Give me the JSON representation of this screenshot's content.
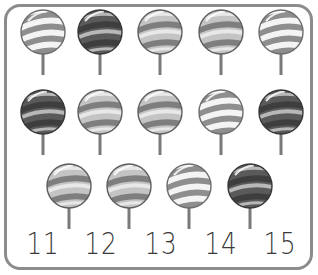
{
  "worksheet": {
    "frame_color": "#8c8c8c",
    "stick_color": "#7a7a7a",
    "lollipops": [
      {
        "row": 1,
        "cx": 43,
        "cy": 32,
        "style": "light"
      },
      {
        "row": 1,
        "cx": 100,
        "cy": 32,
        "style": "dark"
      },
      {
        "row": 1,
        "cx": 160,
        "cy": 32,
        "style": "medium"
      },
      {
        "row": 1,
        "cx": 221,
        "cy": 32,
        "style": "medium"
      },
      {
        "row": 1,
        "cx": 281,
        "cy": 32,
        "style": "light"
      },
      {
        "row": 2,
        "cx": 43,
        "cy": 112,
        "style": "dark"
      },
      {
        "row": 2,
        "cx": 100,
        "cy": 112,
        "style": "medium"
      },
      {
        "row": 2,
        "cx": 160,
        "cy": 112,
        "style": "medium"
      },
      {
        "row": 2,
        "cx": 221,
        "cy": 112,
        "style": "light"
      },
      {
        "row": 2,
        "cx": 281,
        "cy": 112,
        "style": "dark"
      },
      {
        "row": 3,
        "cx": 69,
        "cy": 186,
        "style": "medium"
      },
      {
        "row": 3,
        "cx": 129,
        "cy": 186,
        "style": "medium"
      },
      {
        "row": 3,
        "cx": 189,
        "cy": 186,
        "style": "light"
      },
      {
        "row": 3,
        "cx": 250,
        "cy": 186,
        "style": "dark"
      }
    ],
    "count": 14,
    "number_choices": [
      {
        "label": "11",
        "x": 43
      },
      {
        "label": "12",
        "x": 101
      },
      {
        "label": "13",
        "x": 161
      },
      {
        "label": "14",
        "x": 221
      },
      {
        "label": "15",
        "x": 280
      }
    ],
    "palettes": {
      "light": {
        "base": "#f4f4f4",
        "stripe": "#8e8e8e",
        "rim": "#6d6d6d"
      },
      "medium": {
        "base": "#c4c4c4",
        "stripe": "#7e7e7e",
        "rim": "#5e5e5e",
        "band": "#e8e8e8"
      },
      "dark": {
        "base": "#5a5a5a",
        "stripe": "#3e3e3e",
        "rim": "#383838",
        "band": "#b8b8b8"
      }
    }
  }
}
